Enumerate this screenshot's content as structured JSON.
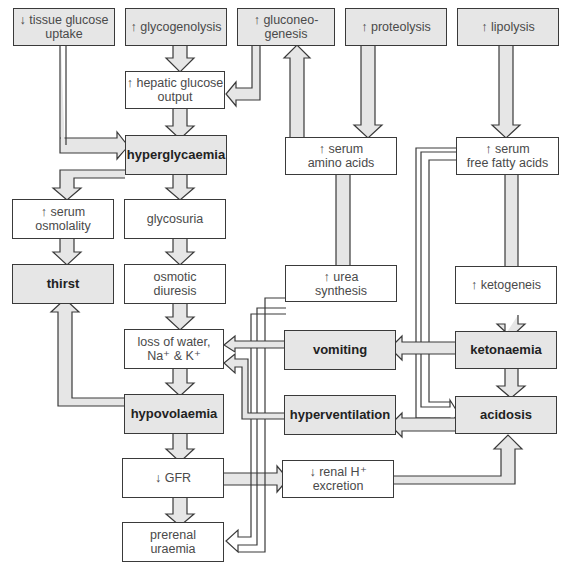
{
  "colors": {
    "shaded_box": "#e6e6e6",
    "white_box": "#ffffff",
    "stroke": "#3a3a3a",
    "arrow_fill": "#e6e6e6"
  },
  "nodes": {
    "tissue_glucose": {
      "label": "↓ tissue glucose\nuptake",
      "shaded": true
    },
    "glycogenolysis": {
      "label": "↑ glycogenolysis",
      "shaded": true
    },
    "gluconeogenesis": {
      "label": "↑ gluconeo-\ngenesis",
      "shaded": true
    },
    "proteolysis": {
      "label": "↑ proteolysis",
      "shaded": true
    },
    "lipolysis": {
      "label": "↑ lipolysis",
      "shaded": true
    },
    "hepatic_glucose": {
      "label": "↑ hepatic glucose\noutput",
      "shaded": false
    },
    "hyperglycaemia": {
      "label": "hyperglycaemia",
      "shaded": true,
      "bold": true
    },
    "serum_amino": {
      "label": "↑ serum\namino acids",
      "shaded": false
    },
    "serum_ffa": {
      "label": "↑ serum\nfree fatty acids",
      "shaded": false
    },
    "serum_osmolality": {
      "label": "↑ serum\nosmolality",
      "shaded": false
    },
    "glycosuria": {
      "label": "glycosuria",
      "shaded": false
    },
    "thirst": {
      "label": "thirst",
      "shaded": true,
      "bold": true
    },
    "osmotic_diuresis": {
      "label": "osmotic\ndiuresis",
      "shaded": false
    },
    "urea_synthesis": {
      "label": "↑ urea\nsynthesis",
      "shaded": false
    },
    "ketogenesis": {
      "label": "↑ ketogeneis",
      "shaded": false
    },
    "loss_water": {
      "label": "loss of water,\nNa⁺ & K⁺",
      "shaded": false
    },
    "vomiting": {
      "label": "vomiting",
      "shaded": true,
      "bold": true
    },
    "ketonaemia": {
      "label": "ketonaemia",
      "shaded": true,
      "bold": true
    },
    "hypovolaemia": {
      "label": "hypovolaemia",
      "shaded": true,
      "bold": true
    },
    "hyperventilation": {
      "label": "hyperventilation",
      "shaded": true,
      "bold": true
    },
    "acidosis": {
      "label": "acidosis",
      "shaded": true,
      "bold": true
    },
    "gfr": {
      "label": "↓ GFR",
      "shaded": false
    },
    "renal_h": {
      "label": "↓ renal H⁺\nexcretion",
      "shaded": false
    },
    "prerenal_uraemia": {
      "label": "prerenal\nuraemia",
      "shaded": false
    }
  },
  "edges": [
    [
      "tissue_glucose",
      "hyperglycaemia"
    ],
    [
      "glycogenolysis",
      "hepatic_glucose"
    ],
    [
      "gluconeogenesis",
      "hepatic_glucose"
    ],
    [
      "hepatic_glucose",
      "hyperglycaemia"
    ],
    [
      "serum_amino",
      "gluconeogenesis"
    ],
    [
      "proteolysis",
      "serum_amino"
    ],
    [
      "lipolysis",
      "serum_ffa"
    ],
    [
      "hyperglycaemia",
      "serum_osmolality"
    ],
    [
      "hyperglycaemia",
      "glycosuria"
    ],
    [
      "serum_osmolality",
      "thirst"
    ],
    [
      "glycosuria",
      "osmotic_diuresis"
    ],
    [
      "osmotic_diuresis",
      "loss_water"
    ],
    [
      "serum_amino",
      "urea_synthesis"
    ],
    [
      "urea_synthesis",
      "prerenal_uraemia"
    ],
    [
      "serum_ffa",
      "ketogenesis"
    ],
    [
      "serum_ffa",
      "acidosis"
    ],
    [
      "ketogenesis",
      "ketonaemia"
    ],
    [
      "ketonaemia",
      "vomiting"
    ],
    [
      "ketonaemia",
      "acidosis"
    ],
    [
      "vomiting",
      "loss_water"
    ],
    [
      "hyperventilation",
      "loss_water"
    ],
    [
      "acidosis",
      "hyperventilation"
    ],
    [
      "loss_water",
      "hypovolaemia"
    ],
    [
      "hypovolaemia",
      "thirst"
    ],
    [
      "hypovolaemia",
      "gfr"
    ],
    [
      "gfr",
      "prerenal_uraemia"
    ],
    [
      "gfr",
      "renal_h"
    ],
    [
      "renal_h",
      "acidosis"
    ]
  ]
}
